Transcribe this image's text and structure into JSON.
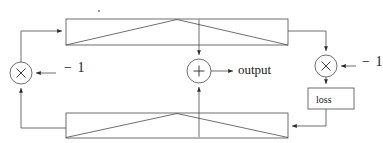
{
  "diagram": {
    "background_color": "#ffffff",
    "stroke_color": "#3a3a3a",
    "text_color": "#1a1a1a",
    "line_width": 0.8,
    "nodes": {
      "top_block": {
        "name": "top-network-block",
        "shape": "rectangle-with-peak",
        "label": "",
        "x": 66,
        "y": 19,
        "width": 222,
        "height": 26
      },
      "bottom_block": {
        "name": "bottom-network-block",
        "shape": "rectangle-with-peak",
        "label": "",
        "x": 66,
        "y": 113,
        "width": 222,
        "height": 25
      },
      "mul_left": {
        "name": "multiply-node-left",
        "glyph": "×",
        "cx": 21,
        "cy": 73,
        "r": 11
      },
      "mul_right": {
        "name": "multiply-node-right",
        "glyph": "×",
        "cx": 326,
        "cy": 66,
        "r": 11
      },
      "add_center": {
        "name": "add-node-center",
        "glyph": "+",
        "cx": 199,
        "cy": 71,
        "r": 12
      },
      "loss_box": {
        "name": "loss-box",
        "label": "loss",
        "x": 308,
        "y": 88,
        "width": 46,
        "height": 21
      }
    },
    "labels": {
      "output": "output",
      "loss": "loss",
      "neg_one_left": "− 1",
      "neg_one_right": "− 1"
    },
    "edges": [
      {
        "name": "edge-mul-left-to-top-block",
        "from": "mul_left",
        "to": "top_block",
        "arrow": true
      },
      {
        "name": "edge-bottom-block-to-mul-left",
        "from": "bottom_block",
        "to": "mul_left",
        "arrow": true
      },
      {
        "name": "edge-neg1-left-to-mul-left",
        "from": "neg_one_left",
        "to": "mul_left",
        "arrow": true
      },
      {
        "name": "edge-top-block-to-mul-right",
        "from": "top_block",
        "to": "mul_right",
        "arrow": true
      },
      {
        "name": "edge-neg1-right-to-mul-right",
        "from": "neg_one_right",
        "to": "mul_right",
        "arrow": true
      },
      {
        "name": "edge-mul-right-to-loss",
        "from": "mul_right",
        "to": "loss_box",
        "arrow": true
      },
      {
        "name": "edge-loss-to-bottom-block",
        "from": "loss_box",
        "to": "bottom_block",
        "arrow": true
      },
      {
        "name": "edge-top-block-to-add",
        "from": "top_block",
        "to": "add_center",
        "arrow": true
      },
      {
        "name": "edge-bottom-block-to-add",
        "from": "bottom_block",
        "to": "add_center",
        "arrow": true
      },
      {
        "name": "edge-add-to-output",
        "from": "add_center",
        "to": "output",
        "arrow": true
      }
    ]
  }
}
